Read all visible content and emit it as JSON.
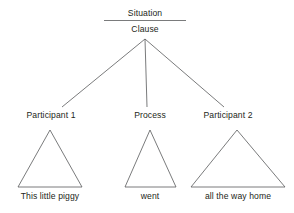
{
  "diagram": {
    "title": "Situation",
    "root": {
      "label": "Clause"
    },
    "nodes": [
      {
        "role_label": "Participant 1",
        "leaf_label": "This little piggy"
      },
      {
        "role_label": "Process",
        "leaf_label": "went"
      },
      {
        "role_label": "Participant 2",
        "leaf_label": "all the way home"
      }
    ],
    "colors": {
      "line": "#58595b",
      "text": "#231f20",
      "background": "#ffffff"
    }
  }
}
